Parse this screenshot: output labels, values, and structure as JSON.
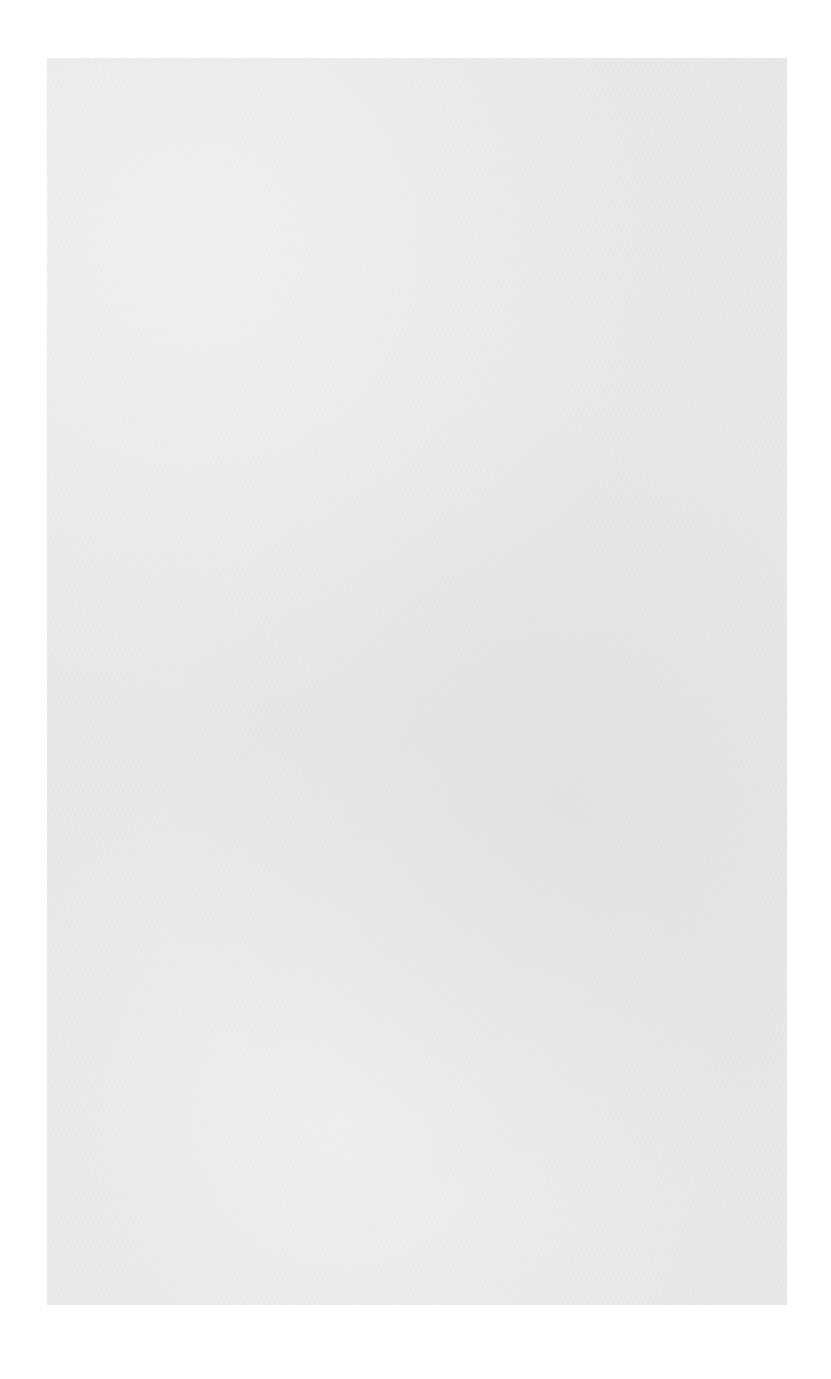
{
  "document": {
    "type": "scanned blank page",
    "background_color": "#ffffff",
    "paper_color": "#ebebeb",
    "paper_bounds": {
      "left": 47,
      "top": 58,
      "width": 740,
      "height": 1247
    },
    "body_text": "",
    "footer_text": ""
  }
}
